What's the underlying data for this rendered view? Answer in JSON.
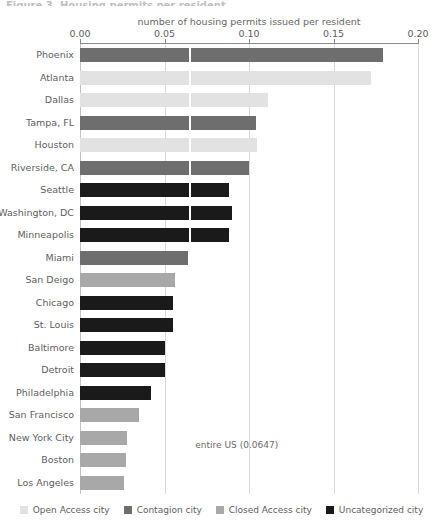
{
  "figure": {
    "title_cut": "Figure 3. Housing permits per resident",
    "annotation": "entire US (0.0647)",
    "annotation_value": 0.0647
  },
  "chart_data": {
    "type": "bar",
    "orientation": "horizontal",
    "title": "",
    "xlabel": "number of housing permits issued per resident",
    "ylabel": "",
    "xlim": [
      0.0,
      0.2
    ],
    "xticks": [
      0.0,
      0.05,
      0.1,
      0.15,
      0.2
    ],
    "xtick_labels": [
      "0.00",
      "0.05",
      "0.10",
      "0.15",
      "0.20"
    ],
    "grid": true,
    "legend_position": "bottom",
    "reference_line": {
      "label": "entire US (0.0647)",
      "value": 0.0647
    },
    "categories": [
      "Phoenix",
      "Atlanta",
      "Dallas",
      "Tampa, FL",
      "Houston",
      "Riverside, CA",
      "Seattle",
      "Washington, DC",
      "Minneapolis",
      "Miami",
      "San Deigo",
      "Chicago",
      "St. Louis",
      "Baltimore",
      "Detroit",
      "Philadelphia",
      "San Francisco",
      "New York City",
      "Boston",
      "Los Angeles"
    ],
    "values": [
      0.179,
      0.172,
      0.111,
      0.104,
      0.105,
      0.1,
      0.088,
      0.09,
      0.088,
      0.064,
      0.056,
      0.055,
      0.055,
      0.05,
      0.05,
      0.042,
      0.035,
      0.028,
      0.027,
      0.026
    ],
    "groups": [
      "contagion",
      "open",
      "open",
      "contagion",
      "open",
      "contagion",
      "uncategorized",
      "uncategorized",
      "uncategorized",
      "contagion",
      "closed",
      "uncategorized",
      "uncategorized",
      "uncategorized",
      "uncategorized",
      "uncategorized",
      "closed",
      "closed",
      "closed",
      "closed"
    ],
    "legend": [
      {
        "key": "open",
        "label": "Open Access city",
        "color": "#e2e2e2"
      },
      {
        "key": "contagion",
        "label": "Contagion city",
        "color": "#6e6e6e"
      },
      {
        "key": "closed",
        "label": "Closed Access city",
        "color": "#a8a8a8"
      },
      {
        "key": "uncategorized",
        "label": "Uncategorized city",
        "color": "#1a1a1a"
      }
    ]
  }
}
